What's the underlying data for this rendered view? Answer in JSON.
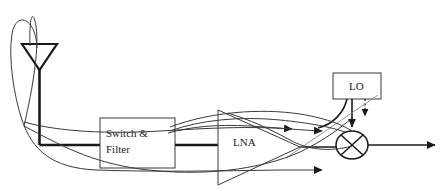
{
  "diagram": {
    "blocks": [
      {
        "id": "switch_filter",
        "label_line1": "Switch &",
        "label_line2": "Filter",
        "shape": "rectangle"
      },
      {
        "id": "lna",
        "label": "LNA",
        "shape": "triangle-amplifier"
      },
      {
        "id": "lo",
        "label": "LO",
        "shape": "rectangle"
      },
      {
        "id": "mixer",
        "label": "",
        "shape": "circle-cross"
      },
      {
        "id": "antenna",
        "label": "",
        "shape": "triangle-antenna"
      }
    ],
    "icons": {
      "antenna": "antenna-icon",
      "mixer": "mixer-cross-icon",
      "amplifier": "amplifier-triangle-icon",
      "arrow": "arrowhead-icon"
    },
    "colors": {
      "line": "#1a1a1a",
      "thin_line": "#3a3a3a",
      "background": "#ffffff",
      "text": "#1a1a1a"
    },
    "line_widths": {
      "main_signal": 2.6,
      "block_outline": 1.0,
      "overlay_curve": 1.0,
      "dotted": 1.2
    }
  }
}
